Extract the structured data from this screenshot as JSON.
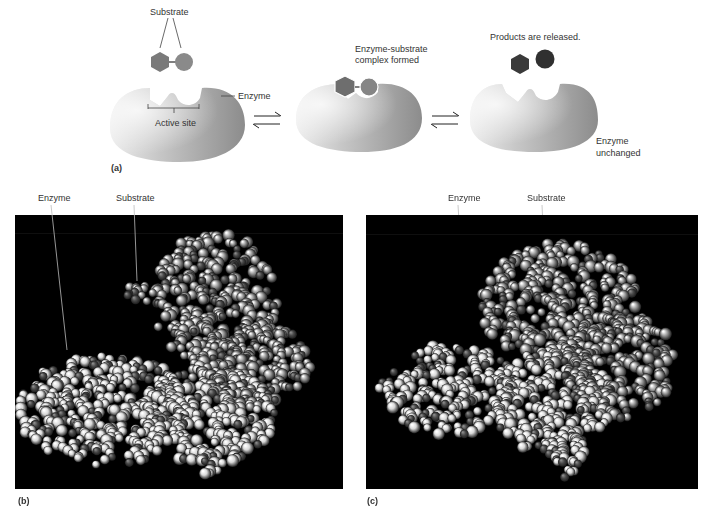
{
  "panel_a": {
    "letter": "(a)",
    "substrate_label": "Substrate",
    "enzyme_label": "Enzyme",
    "active_site_label": "Active site",
    "complex_label_line1": "Enzyme-substrate",
    "complex_label_line2": "complex formed",
    "products_label": "Products are released.",
    "unchanged_line1": "Enzyme",
    "unchanged_line2": "unchanged",
    "arrow_icon": "equilibrium-arrows-icon"
  },
  "panel_b": {
    "letter": "(b)",
    "enzyme_label": "Enzyme",
    "substrate_label": "Substrate"
  },
  "panel_c": {
    "letter": "(c)",
    "enzyme_label": "Enzyme",
    "substrate_label": "Substrate"
  },
  "colors": {
    "substrate_fill": "#7a7a7a",
    "product_fill": "#3a3a3a",
    "enzyme_light": "#e6e6e6",
    "enzyme_dark": "#8a8a8a",
    "photo_bg": "#000000",
    "atom_light": "#d8d8d8",
    "atom_mid": "#9a9a9a",
    "atom_dark": "#4a4a4a"
  },
  "molecules": {
    "b": {
      "width": 328,
      "height": 274,
      "blobs": [
        {
          "cx": 200,
          "cy": 85,
          "rx": 62,
          "ry": 68,
          "tone": "mid"
        },
        {
          "cx": 235,
          "cy": 150,
          "rx": 60,
          "ry": 45,
          "tone": "mid"
        },
        {
          "cx": 90,
          "cy": 195,
          "rx": 88,
          "ry": 55,
          "tone": "light"
        },
        {
          "cx": 190,
          "cy": 200,
          "rx": 70,
          "ry": 50,
          "tone": "light"
        },
        {
          "cx": 195,
          "cy": 245,
          "rx": 12,
          "ry": 18,
          "tone": "light"
        }
      ],
      "substrate": {
        "cx": 125,
        "cy": 78,
        "rx": 13,
        "ry": 11
      },
      "seed": 7
    },
    "c": {
      "width": 332,
      "height": 274,
      "blobs": [
        {
          "cx": 195,
          "cy": 90,
          "rx": 80,
          "ry": 62,
          "tone": "mid"
        },
        {
          "cx": 255,
          "cy": 150,
          "rx": 55,
          "ry": 55,
          "tone": "mid"
        },
        {
          "cx": 85,
          "cy": 175,
          "rx": 72,
          "ry": 45,
          "tone": "light"
        },
        {
          "cx": 185,
          "cy": 185,
          "rx": 60,
          "ry": 55,
          "tone": "light"
        },
        {
          "cx": 200,
          "cy": 238,
          "rx": 18,
          "ry": 25,
          "tone": "light"
        }
      ],
      "seed": 13
    }
  }
}
